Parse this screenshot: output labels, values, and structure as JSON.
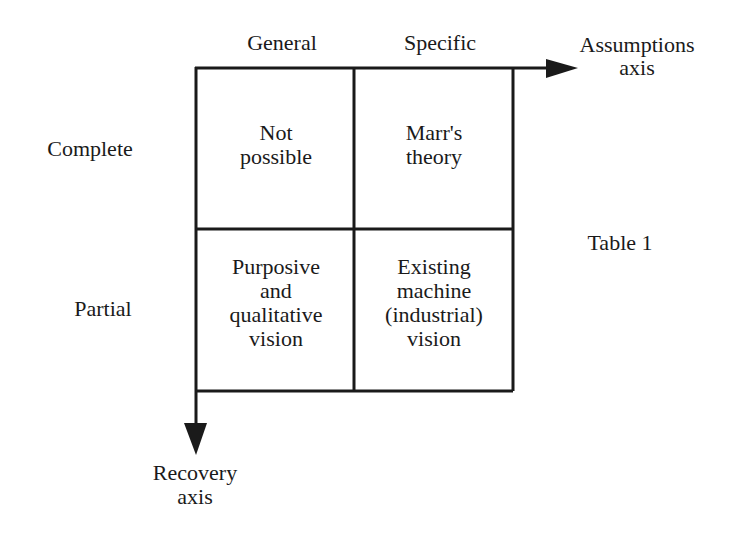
{
  "diagram": {
    "columns": [
      "General",
      "Specific"
    ],
    "rows": [
      "Complete",
      "Partial"
    ],
    "axes": {
      "horizontal": [
        "Assumptions",
        "axis"
      ],
      "vertical": [
        "Recovery",
        "axis"
      ]
    },
    "cells": {
      "complete_general": [
        "Not",
        "possible"
      ],
      "complete_specific": [
        "Marr's",
        "theory"
      ],
      "partial_general": [
        "Purposive",
        "and",
        "qualitative",
        "vision"
      ],
      "partial_specific": [
        "Existing",
        "machine",
        "(industrial)",
        "vision"
      ]
    },
    "caption": "Table 1"
  }
}
